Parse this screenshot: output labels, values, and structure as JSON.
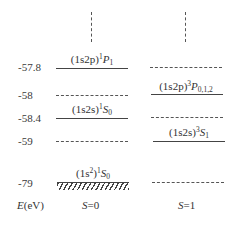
{
  "diagram": {
    "type": "energy-level-diagram",
    "axis": {
      "label_symbol": "E",
      "label_unit": "(eV)",
      "ticks": [
        "-57.8",
        "-58",
        "-58.4",
        "-59",
        "-79"
      ]
    },
    "columns": [
      {
        "label_symbol": "S",
        "label_value": "=0"
      },
      {
        "label_symbol": "S",
        "label_value": "=1"
      }
    ],
    "levels": [
      {
        "energy": "-57.8",
        "singlet": {
          "config": "(1s2p)",
          "mult": "1",
          "term": "P",
          "j": "1",
          "style": "solid"
        },
        "triplet": {
          "style": "dashed"
        }
      },
      {
        "energy": "-58",
        "singlet": {
          "style": "dashed"
        },
        "triplet": {
          "config": "(1s2p)",
          "mult": "3",
          "term": "P",
          "j": "0,1,2",
          "style": "solid"
        }
      },
      {
        "energy": "-58.4",
        "singlet": {
          "config": "(1s2s)",
          "mult": "1",
          "term": "S",
          "j": "0",
          "style": "solid"
        },
        "triplet": {
          "style": "dashed"
        }
      },
      {
        "energy": "-59",
        "singlet": {
          "style": "dashed"
        },
        "triplet": {
          "config": "(1s2s)",
          "mult": "3",
          "term": "S",
          "j": "1",
          "style": "solid"
        }
      },
      {
        "energy": "-79",
        "singlet": {
          "config_base": "(1s",
          "config_exp": "2",
          "config_close": ")",
          "mult": "1",
          "term": "S",
          "j": "0",
          "style": "ground-hatched"
        },
        "triplet": {
          "style": "dashed"
        }
      }
    ],
    "continuation": "vertical dashed lines above both columns"
  }
}
